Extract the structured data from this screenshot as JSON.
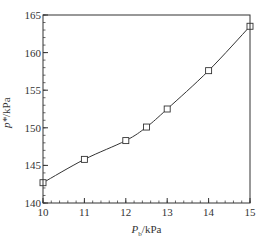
{
  "chart_data": {
    "type": "line",
    "title": "",
    "xlabel": "P_b / kPa",
    "ylabel": "p* / kPa",
    "xlabel_parts": {
      "symbol": "P",
      "subscript": "b",
      "unit": "/kPa"
    },
    "ylabel_parts": {
      "symbol": "p*",
      "unit": "/kPa"
    },
    "xlim": [
      10,
      15
    ],
    "ylim": [
      140,
      165
    ],
    "x_ticks": [
      10,
      11,
      12,
      13,
      14,
      15
    ],
    "x_tick_labels": [
      "10",
      "11",
      "12",
      "13",
      "14",
      "15"
    ],
    "y_ticks": [
      140,
      145,
      150,
      155,
      160,
      165
    ],
    "y_tick_labels": [
      "140",
      "145",
      "150",
      "155",
      "160",
      "165"
    ],
    "x_minor_step": 0.2,
    "y_minor_step": 1,
    "grid": false,
    "legend": null,
    "series": [
      {
        "name": "p*",
        "marker": "square",
        "color": "#333333",
        "x": [
          10,
          11,
          12,
          12.5,
          13,
          14,
          15
        ],
        "y": [
          142.7,
          145.8,
          148.3,
          150.1,
          152.5,
          157.6,
          163.5
        ]
      }
    ]
  },
  "layout": {
    "plot_left": 43,
    "plot_top": 15,
    "plot_right": 250,
    "plot_bottom": 203
  }
}
